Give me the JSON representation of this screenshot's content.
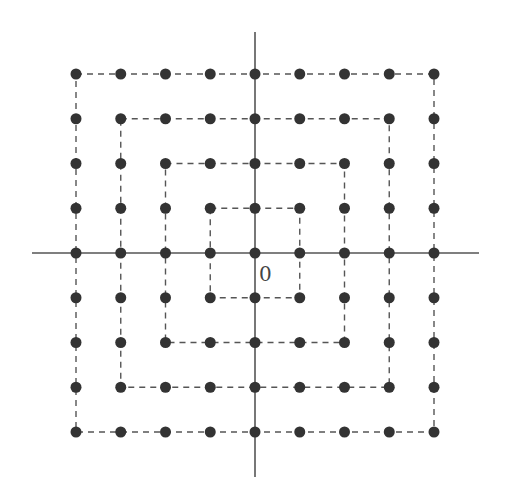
{
  "diagram": {
    "origin_label": "0",
    "grid_range": [
      -4,
      4
    ],
    "ring_count": 4,
    "rings": [
      {
        "level": 1,
        "half_size": 1
      },
      {
        "level": 2,
        "half_size": 2
      },
      {
        "level": 3,
        "half_size": 3
      },
      {
        "level": 4,
        "half_size": 4
      }
    ],
    "points_per_ring": [
      8,
      16,
      24,
      32
    ],
    "include_origin_point": true,
    "layout": {
      "center_x": 255,
      "center_y": 253,
      "spacing": 44.75,
      "axis_h": {
        "x1": 32,
        "x2": 479
      },
      "axis_v": {
        "y1": 32,
        "y2": 477
      },
      "dot_radius": 5.5
    },
    "colors": {
      "dot": "#333333",
      "axis": "#555555",
      "ring": "#555555",
      "label": "#444444",
      "background": "#ffffff"
    }
  }
}
